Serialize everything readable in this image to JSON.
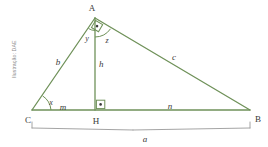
{
  "figure": {
    "type": "right-triangle-with-altitude",
    "background_color": "#ffffff",
    "stroke_color": "#6f9159",
    "bracket_color": "#9a9a9a",
    "text_color": "#3a3a3a",
    "credit_text": "Ilustração: DAE"
  },
  "vertices": {
    "A": {
      "label": "A",
      "x": 95,
      "y": 18
    },
    "B": {
      "label": "B",
      "x": 250,
      "y": 110
    },
    "C": {
      "label": "C",
      "x": 32,
      "y": 110
    },
    "H": {
      "label": "H",
      "x": 95,
      "y": 110
    }
  },
  "segments": {
    "b": {
      "label": "b",
      "from": "C",
      "to": "A"
    },
    "c": {
      "label": "c",
      "from": "A",
      "to": "B"
    },
    "a": {
      "label": "a",
      "from": "C",
      "to": "B"
    },
    "h": {
      "label": "h",
      "from": "A",
      "to": "H"
    },
    "m": {
      "label": "m",
      "from": "C",
      "to": "H"
    },
    "n": {
      "label": "n",
      "from": "H",
      "to": "B"
    }
  },
  "angles": {
    "x": {
      "label": "x",
      "at": "C"
    },
    "y": {
      "label": "y",
      "at": "A",
      "side": "left-of-altitude"
    },
    "z": {
      "label": "z",
      "at": "A",
      "side": "right-of-altitude"
    },
    "right_angle_A": {
      "marker": "right-angle-square-dot",
      "at": "A"
    },
    "right_angle_H": {
      "marker": "right-angle-square-dot",
      "at": "H"
    }
  },
  "labels": {
    "A": "A",
    "B": "B",
    "C": "C",
    "H": "H",
    "a": "a",
    "b": "b",
    "c": "c",
    "h": "h",
    "m": "m",
    "n": "n",
    "x": "x",
    "y": "y",
    "z": "z",
    "credit": "Ilustração: DAE"
  }
}
